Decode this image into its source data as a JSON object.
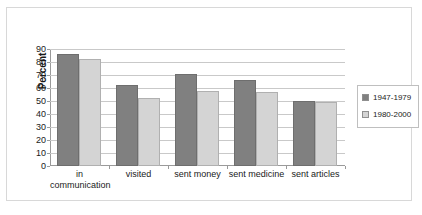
{
  "chart_data": {
    "type": "bar",
    "title": "",
    "xlabel": "",
    "ylabel": "Percent",
    "ylim": [
      0,
      90
    ],
    "ytick_step": 10,
    "yticks": [
      0,
      10,
      20,
      30,
      40,
      50,
      60,
      70,
      80,
      90
    ],
    "grid": true,
    "legend_position": "right",
    "categories": [
      "in communication",
      "visited",
      "sent money",
      "sent medicine",
      "sent articles"
    ],
    "category_lines": [
      [
        "in",
        "communication"
      ],
      [
        "visited"
      ],
      [
        "sent money"
      ],
      [
        "sent medicine"
      ],
      [
        "sent articles"
      ]
    ],
    "series": [
      {
        "name": "1947-1979",
        "color": "#808080",
        "values": [
          86,
          62,
          71,
          66,
          50
        ]
      },
      {
        "name": "1980-2000",
        "color": "#d4d4d4",
        "values": [
          82,
          52,
          58,
          57,
          49
        ]
      }
    ]
  },
  "colors": {
    "series_1947_1979": "#808080",
    "series_1980_2000": "#d4d4d4",
    "gridline": "#c9c9c9",
    "axis": "#9a9a9a",
    "frame_border": "#d8d8d8",
    "legend_border": "#bfbfbf",
    "text": "#1a1a1a"
  }
}
